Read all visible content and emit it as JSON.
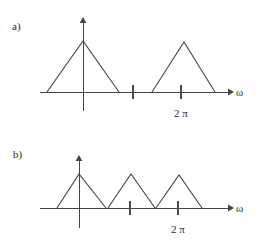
{
  "figure": {
    "background_color": "#ffffff",
    "line_color": "#444444",
    "text_color": "#2b2b2b",
    "width": 262,
    "height": 249
  },
  "panels": [
    {
      "id": "panel-a",
      "label": "a)",
      "label_pos": {
        "x": 12,
        "y": 30
      },
      "axis": {
        "x_label": "ω",
        "x_label_pos": {
          "x": 236,
          "y": 93
        },
        "baseline_y": 92,
        "x_start": 40,
        "x_end": 228,
        "arrow_tip_x": 234,
        "vertical_axis_x": 83,
        "vertical_top_y": 22,
        "vertical_bottom_y": 111,
        "vertical_arrow_tip_y": 18
      },
      "ticks": [
        {
          "name": "tick-pi",
          "x": 133,
          "label": ""
        },
        {
          "name": "tick-2pi",
          "x": 181,
          "label": "2 π",
          "label_pos": {
            "x": 181,
            "y": 117
          }
        }
      ],
      "triangles": [
        {
          "name": "triangle-baseband",
          "left": 47,
          "right": 119,
          "apex_x": 83,
          "apex_y": 41
        },
        {
          "name": "triangle-replica-2pi",
          "left": 152,
          "right": 215,
          "apex_x": 184,
          "apex_y": 42
        }
      ]
    },
    {
      "id": "panel-b",
      "label": "b)",
      "label_pos": {
        "x": 13,
        "y": 158
      },
      "axis": {
        "x_label": "ω",
        "x_label_pos": {
          "x": 236,
          "y": 209
        },
        "baseline_y": 208,
        "x_start": 40,
        "x_end": 228,
        "arrow_tip_x": 234,
        "vertical_axis_x": 79,
        "vertical_top_y": 160,
        "vertical_bottom_y": 228,
        "vertical_arrow_tip_y": 156
      },
      "ticks": [
        {
          "name": "tick-pi",
          "x": 130,
          "label": ""
        },
        {
          "name": "tick-2pi",
          "x": 178,
          "label": "2 π",
          "label_pos": {
            "x": 178,
            "y": 233
          }
        }
      ],
      "triangles": [
        {
          "name": "triangle-baseband",
          "left": 57,
          "right": 106,
          "apex_x": 79,
          "apex_y": 174
        },
        {
          "name": "triangle-replica-1",
          "left": 108,
          "right": 155,
          "apex_x": 131,
          "apex_y": 174
        },
        {
          "name": "triangle-replica-2",
          "left": 156,
          "right": 202,
          "apex_x": 179,
          "apex_y": 175
        }
      ]
    }
  ]
}
